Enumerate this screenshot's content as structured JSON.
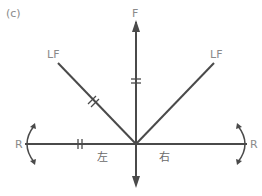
{
  "panel_label": "(c)",
  "labels": {
    "forward": "F",
    "left_forward": "LF",
    "right_forward": "LF",
    "rotate_left": "R",
    "rotate_right": "R",
    "left": "左",
    "right": "右"
  },
  "colors": {
    "line": "#4a4a4a",
    "label": "#8a8a8a"
  }
}
